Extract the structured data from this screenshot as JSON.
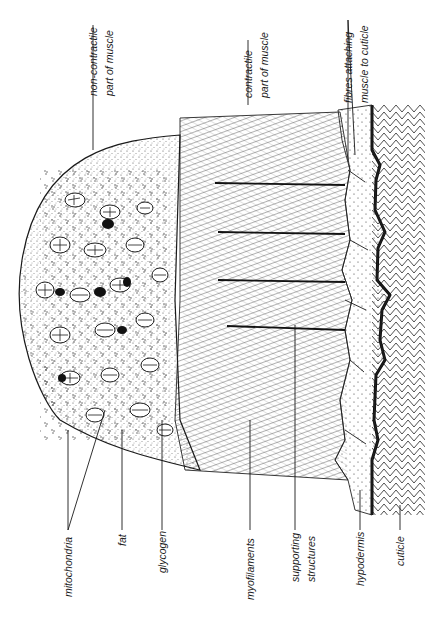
{
  "figure": {
    "labels": {
      "non_contractile": [
        "non-contractile",
        "part of muscle"
      ],
      "contractile": [
        "contractile",
        "part of muscle"
      ],
      "fibres": [
        "fibres attaching",
        "muscle to cuticle"
      ],
      "mitochondria": "mitochondria",
      "fat": "fat",
      "glycogen": "glycogen",
      "myofilaments": "myofilaments",
      "supporting_structures": [
        "supporting",
        "structures"
      ],
      "hypodermis": "hypodermis",
      "cuticle": "cuticle"
    }
  }
}
